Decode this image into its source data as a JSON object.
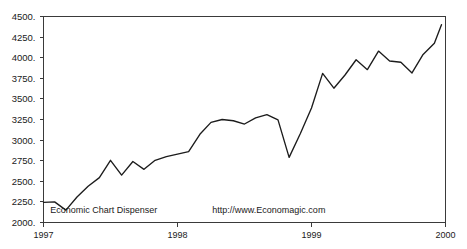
{
  "chart_data": {
    "type": "line",
    "title": "",
    "subtitle": "",
    "xlabel": "",
    "ylabel": "",
    "xlim": [
      1997.0,
      2000.0
    ],
    "ylim": [
      2000,
      4500
    ],
    "grid": false,
    "legend": null,
    "y_ticks": [
      2000,
      2250,
      2500,
      2750,
      3000,
      3250,
      3500,
      3750,
      4000,
      4250,
      4500
    ],
    "y_tick_labels": [
      "2000.",
      "2250.",
      "2500.",
      "2750.",
      "3000.",
      "3250.",
      "3500.",
      "3750.",
      "4000.",
      "4250.",
      "4500."
    ],
    "x_ticks": [
      1997,
      1998,
      1999,
      2000
    ],
    "x_tick_labels": [
      "1997",
      "1998",
      "1999",
      "2000"
    ],
    "annotations": [
      {
        "name": "source-credit",
        "text": "Economic Chart Dispenser",
        "x": 1997.05,
        "y": 2110
      },
      {
        "name": "source-url",
        "text": "http://www.Economagic.com",
        "x": 1998.26,
        "y": 2110
      }
    ],
    "series": [
      {
        "name": "index",
        "color": "#1c1c1c",
        "x": [
          1997.0,
          1997.083,
          1997.167,
          1997.25,
          1997.333,
          1997.417,
          1997.5,
          1997.583,
          1997.667,
          1997.75,
          1997.833,
          1997.917,
          1998.0,
          1998.083,
          1998.167,
          1998.25,
          1998.333,
          1998.417,
          1998.5,
          1998.583,
          1998.667,
          1998.75,
          1998.833,
          1998.917,
          1999.0,
          1999.083,
          1999.167,
          1999.25,
          1999.333,
          1999.417,
          1999.5,
          1999.583,
          1999.667,
          1999.75,
          1999.833,
          1999.917
        ],
        "values": [
          2245,
          2250,
          2150,
          2310,
          2440,
          2545,
          2755,
          2575,
          2740,
          2645,
          2755,
          2800,
          2830,
          2860,
          3070,
          3215,
          3250,
          3235,
          3195,
          3270,
          3310,
          3245,
          2790,
          3080,
          3390,
          3810,
          3630,
          3790,
          3975,
          3855,
          4080,
          3960,
          3945,
          3815,
          4040,
          4175
        ]
      }
    ],
    "final_value": 4400
  },
  "figure": {
    "background_color": "#ffffff",
    "frame_color": "#3a3a3a",
    "line_color": "#1c1c1c"
  }
}
